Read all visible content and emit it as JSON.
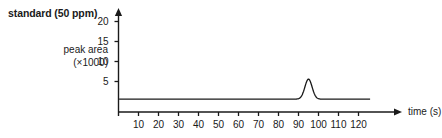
{
  "chart_data": {
    "type": "line",
    "title": "standard (50 ppm)",
    "ylabel": "peak area",
    "ylabel_sub": "(×1000)",
    "xlabel": "time (s)",
    "x_ticks": [
      10,
      20,
      30,
      40,
      50,
      60,
      70,
      80,
      90,
      100,
      110,
      120
    ],
    "x_tick_labels": [
      "10",
      "20",
      "30",
      "40",
      "50",
      "60",
      "70",
      "80",
      "90",
      "100",
      "110",
      "120"
    ],
    "y_ticks": [
      5,
      10,
      15,
      20
    ],
    "y_tick_labels": [
      "5",
      "10",
      "15",
      "20"
    ],
    "xlim": [
      0,
      130
    ],
    "ylim": [
      0,
      23
    ],
    "grid": false,
    "legend": "none",
    "axis_arrows": true,
    "series": [
      {
        "name": "chromatogram",
        "color": "#1a1a1a",
        "baseline": 0.6,
        "peaks": [
          {
            "center": 95,
            "height": 5.0,
            "width": 1.8
          }
        ],
        "trace_end": 126
      }
    ],
    "annotations": []
  },
  "colors": {
    "axis": "#1a1a1a",
    "trace": "#1a1a1a",
    "text": "#1a1a1a",
    "background": "#ffffff"
  }
}
